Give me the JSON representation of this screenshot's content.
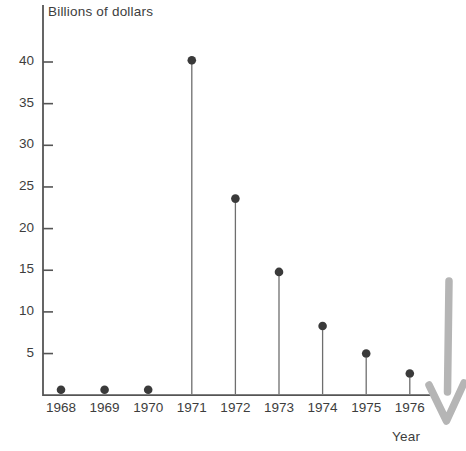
{
  "chart_data": {
    "type": "scatter",
    "title": "",
    "subtitle": "",
    "xlabel": "Year",
    "ylabel": "Billions of dollars",
    "categories": [
      "1968",
      "1969",
      "1970",
      "1971",
      "1972",
      "1973",
      "1974",
      "1975",
      "1976"
    ],
    "values": [
      0.6,
      0.6,
      0.6,
      40.2,
      23.6,
      14.8,
      8.3,
      5.0,
      2.6
    ],
    "series": [
      {
        "name": "Billions of dollars",
        "values": [
          0.6,
          0.6,
          0.6,
          40.2,
          23.6,
          14.8,
          8.3,
          5.0,
          2.6
        ]
      }
    ],
    "ylim": [
      0,
      44
    ],
    "yticks": [
      5,
      10,
      15,
      20,
      25,
      30,
      35,
      40
    ],
    "ytick_labels": [
      "5",
      "10",
      "15",
      "20",
      "25",
      "30",
      "35",
      "40"
    ],
    "xtick_labels": [
      "1968",
      "1969",
      "1970",
      "1971",
      "1972",
      "1973",
      "1974",
      "1975",
      "1976"
    ],
    "grid": false,
    "legend": "none",
    "marker": "filled-circle",
    "stems": true,
    "marker_color": "#3a3a3a",
    "axis_color": "#555555",
    "background_color": "#ffffff"
  },
  "annotations": [
    {
      "name": "down-arrow-annotation",
      "shape": "hand-drawn-down-arrow",
      "color": "#b4b4b4",
      "label": ""
    }
  ],
  "labels": {
    "y_axis_title": "Billions of dollars",
    "x_axis_title": "Year"
  }
}
